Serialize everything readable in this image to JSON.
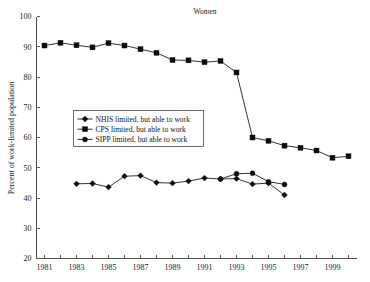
{
  "chart_data": {
    "type": "line",
    "title": "Women",
    "xlabel": "",
    "ylabel": "Percent of work-limited population",
    "xlim": [
      1980.5,
      2000.5
    ],
    "ylim": [
      20,
      100
    ],
    "yticks": [
      20,
      30,
      40,
      50,
      60,
      70,
      80,
      90,
      100
    ],
    "ytick_labels": [
      "20",
      "30",
      "40",
      "50",
      "60",
      "70",
      "80",
      "90",
      "100"
    ],
    "xticks": [
      1981,
      1982,
      1983,
      1984,
      1985,
      1986,
      1987,
      1988,
      1989,
      1990,
      1991,
      1992,
      1993,
      1994,
      1995,
      1996,
      1997,
      1998,
      1999,
      2000
    ],
    "xtick_labels": [
      "1981",
      "",
      "1983",
      "",
      "1985",
      "",
      "1987",
      "",
      "1989",
      "",
      "1991",
      "",
      "1993",
      "",
      "1995",
      "",
      "1997",
      "",
      "1999",
      ""
    ],
    "grid": false,
    "legend_position": "center-left",
    "series": [
      {
        "name": "NHIS limited, but able to work",
        "marker": "diamond",
        "color": "#0d0d0d",
        "x": [
          1983,
          1984,
          1985,
          1986,
          1987,
          1988,
          1989,
          1990,
          1991,
          1992,
          1993,
          1994,
          1995,
          1996
        ],
        "values": [
          44.7,
          44.8,
          43.6,
          47.2,
          47.4,
          45.1,
          44.9,
          45.6,
          46.6,
          46.3,
          46.4,
          44.6,
          44.9,
          41.0
        ]
      },
      {
        "name": "CPS limited, but able to work",
        "marker": "square",
        "color": "#0d0d0d",
        "x": [
          1981,
          1982,
          1983,
          1984,
          1985,
          1986,
          1987,
          1988,
          1989,
          1990,
          1991,
          1992,
          1993,
          1994,
          1995,
          1996,
          1997,
          1998,
          1999,
          2000
        ],
        "values": [
          90.4,
          91.3,
          90.5,
          89.8,
          91.2,
          90.4,
          89.2,
          88.0,
          85.6,
          85.5,
          84.9,
          85.3,
          81.5,
          60.0,
          58.9,
          57.3,
          56.6,
          55.7,
          53.3,
          53.8
        ]
      },
      {
        "name": "SIPP limited, but able to work",
        "marker": "circle",
        "color": "#0d0d0d",
        "x": [
          1992,
          1993,
          1994,
          1995,
          1996
        ],
        "values": [
          46.3,
          48.0,
          48.2,
          45.4,
          44.5
        ]
      }
    ]
  },
  "legend": {
    "entries": [
      {
        "label": "NHIS limited, but able to work",
        "marker": "diamond"
      },
      {
        "label": "CPS limited, but able to work",
        "marker": "square"
      },
      {
        "label": "SIPP limited, but able to work",
        "marker": "circle"
      }
    ]
  }
}
